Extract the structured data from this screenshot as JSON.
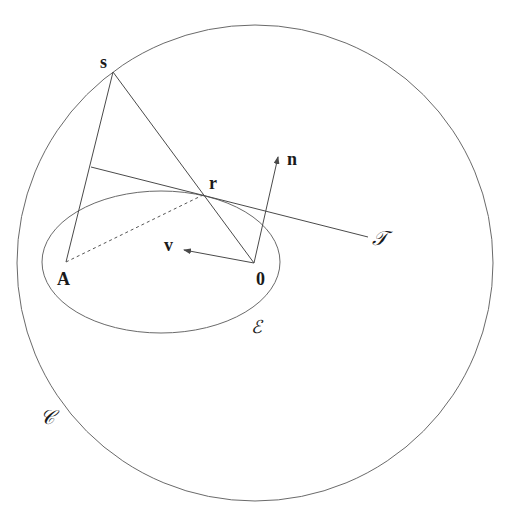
{
  "diagram": {
    "colors": {
      "background": "#ffffff",
      "curve": "#6a6a6a",
      "line": "#4a4a4a",
      "label": "#1a1a1a"
    },
    "shapes": {
      "circle_C": {
        "cx": 255,
        "cy": 263,
        "r": 238
      },
      "ellipse_E": {
        "cx": 161,
        "cy": 262,
        "rx": 119,
        "ry": 71
      }
    },
    "points": {
      "s": {
        "x": 113,
        "y": 72
      },
      "r": {
        "x": 203,
        "y": 195
      },
      "origin": {
        "x": 254,
        "y": 263
      },
      "A": {
        "x": 66,
        "y": 262
      },
      "tangent_start": {
        "x": 91,
        "y": 167
      },
      "tangent_end": {
        "x": 368,
        "y": 237
      },
      "n_tip": {
        "x": 278,
        "y": 157
      },
      "v_tip": {
        "x": 184,
        "y": 250
      }
    },
    "labels": {
      "s": "s",
      "r": "r",
      "n": "n",
      "v": "v",
      "A": "A",
      "origin": "0",
      "tangent": "𝒯",
      "ellipse": "ℰ",
      "circle": "𝒞"
    }
  }
}
